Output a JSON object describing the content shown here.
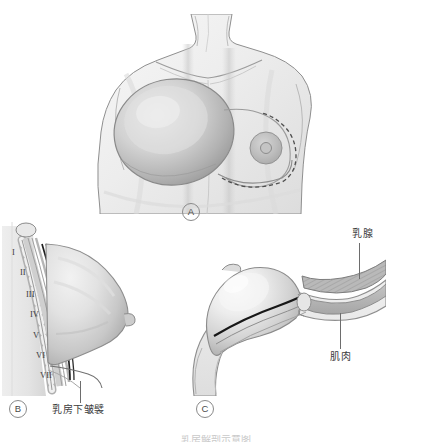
{
  "figure": {
    "title": "乳房解剖示意图",
    "background_color": "#ffffff",
    "line_color": "#555555",
    "tissue_fill": "#d9d9d9",
    "shadow_fill": "#b5b5b5",
    "muscle_fill": "#a8a8a8"
  },
  "panels": [
    {
      "id": "A",
      "badge": "A",
      "name": "frontal-view",
      "caption": ""
    },
    {
      "id": "B",
      "badge": "B",
      "name": "lateral-view",
      "caption": ""
    },
    {
      "id": "C",
      "badge": "C",
      "name": "cross-section-view",
      "caption": ""
    }
  ],
  "labels": {
    "inframammary_fold": "乳房下皱襞",
    "mammary_gland": "乳腺",
    "muscle": "肌肉"
  },
  "rib_numerals": [
    "I",
    "II",
    "III",
    "IV",
    "V",
    "VI",
    "VII"
  ],
  "bottom_caption": "乳房下皱襞"
}
